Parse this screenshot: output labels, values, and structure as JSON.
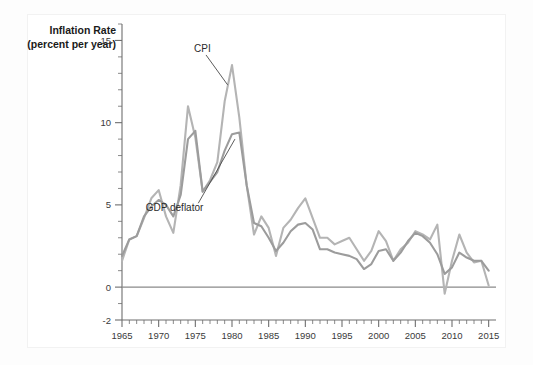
{
  "chart_data": {
    "type": "line",
    "title": "",
    "ylabel": "Inflation Rate (percent per year)",
    "ylabel_line1": "Inflation Rate",
    "ylabel_line2": "(percent per year)",
    "xlabel": "",
    "ylim": [
      -2,
      16
    ],
    "xlim": [
      1965,
      2016
    ],
    "ytick_labels": [
      "15",
      "10",
      "5",
      "0",
      "-2"
    ],
    "ytick_values": [
      15,
      10,
      5,
      0,
      -2
    ],
    "xtick_labels": [
      "1965",
      "1970",
      "1975",
      "1980",
      "1985",
      "1990",
      "1995",
      "2000",
      "2005",
      "2010",
      "2015"
    ],
    "xtick_values": [
      1965,
      1970,
      1975,
      1980,
      1985,
      1990,
      1995,
      2000,
      2005,
      2010,
      2015
    ],
    "minor_tick_interval": 1,
    "grid": false,
    "legend_position": "inline-annotation",
    "zero_line": true,
    "annotations": [
      {
        "text": "CPI",
        "x": 1977.0,
        "y": 14.3
      },
      {
        "text": "GDP deflator",
        "x": 1972.6,
        "y": 4.6
      }
    ],
    "x": [
      1965,
      1966,
      1967,
      1968,
      1969,
      1970,
      1971,
      1972,
      1973,
      1974,
      1975,
      1976,
      1977,
      1978,
      1979,
      1980,
      1981,
      1982,
      1983,
      1984,
      1985,
      1986,
      1987,
      1988,
      1989,
      1990,
      1991,
      1992,
      1993,
      1994,
      1995,
      1996,
      1997,
      1998,
      1999,
      2000,
      2001,
      2002,
      2003,
      2004,
      2005,
      2006,
      2007,
      2008,
      2009,
      2010,
      2011,
      2012,
      2013,
      2014,
      2015
    ],
    "series": [
      {
        "name": "CPI",
        "color": "#b4b4b4",
        "values": [
          1.6,
          2.9,
          3.1,
          4.2,
          5.4,
          5.9,
          4.3,
          3.3,
          6.2,
          11.0,
          9.1,
          5.8,
          6.5,
          7.6,
          11.3,
          13.5,
          10.3,
          6.2,
          3.2,
          4.3,
          3.6,
          1.9,
          3.6,
          4.1,
          4.8,
          5.4,
          4.2,
          3.0,
          3.0,
          2.6,
          2.8,
          3.0,
          2.3,
          1.6,
          2.2,
          3.4,
          2.8,
          1.6,
          2.3,
          2.7,
          3.4,
          3.2,
          2.9,
          3.8,
          -0.4,
          1.6,
          3.2,
          2.1,
          1.5,
          1.6,
          0.1
        ]
      },
      {
        "name": "GDP deflator",
        "color": "#9c9c9c",
        "values": [
          1.9,
          2.9,
          3.1,
          4.3,
          4.9,
          5.3,
          5.0,
          4.3,
          5.6,
          9.0,
          9.5,
          5.8,
          6.4,
          7.0,
          8.3,
          9.3,
          9.4,
          6.2,
          3.9,
          3.7,
          3.0,
          2.2,
          2.7,
          3.4,
          3.8,
          3.9,
          3.5,
          2.3,
          2.3,
          2.1,
          2.0,
          1.9,
          1.7,
          1.1,
          1.4,
          2.2,
          2.3,
          1.6,
          2.1,
          2.8,
          3.3,
          3.1,
          2.7,
          2.0,
          0.8,
          1.2,
          2.1,
          1.8,
          1.6,
          1.6,
          1.0
        ]
      }
    ]
  }
}
